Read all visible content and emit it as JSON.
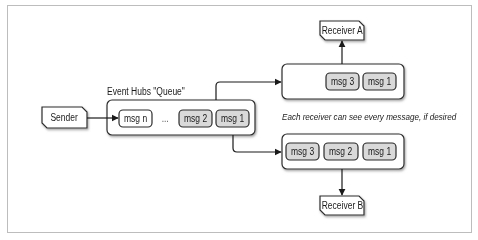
{
  "diagram": {
    "title": "Event Hubs \"Queue\"",
    "caption": "Each receiver can see every message, if desired",
    "colors": {
      "border": "#2b2b2b",
      "msg_fill_new": "#ffffff",
      "msg_fill_shaded": "#d9d9d9",
      "shadow": "#9a9a9a",
      "frame": "#bdbdbd"
    },
    "sender": {
      "label": "Sender"
    },
    "queue": {
      "label": "Event Hubs \"Queue\"",
      "messages": [
        "msg n",
        "msg 2",
        "msg 1"
      ],
      "ellipsis": "..."
    },
    "receiver_a": {
      "label": "Receiver A",
      "messages": [
        "msg 3",
        "msg 1"
      ]
    },
    "receiver_b": {
      "label": "Receiver B",
      "messages": [
        "msg 3",
        "msg 2",
        "msg 1"
      ]
    },
    "edges": [
      {
        "from": "Sender",
        "to": "Event Hubs \"Queue\""
      },
      {
        "from": "Event Hubs \"Queue\"",
        "to": "Receiver A partition view"
      },
      {
        "from": "Event Hubs \"Queue\"",
        "to": "Receiver B partition view"
      },
      {
        "from": "Receiver A partition view",
        "to": "Receiver A"
      },
      {
        "from": "Receiver B partition view",
        "to": "Receiver B"
      }
    ]
  }
}
